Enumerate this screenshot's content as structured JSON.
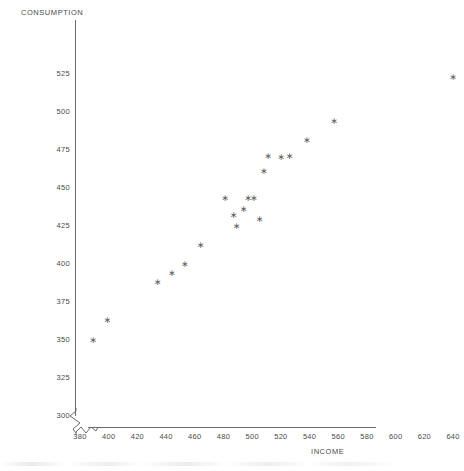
{
  "chart_data": {
    "type": "scatter",
    "title": "",
    "xlabel": "INCOME",
    "ylabel": "CONSUMPTION",
    "xlim": [
      370,
      648
    ],
    "ylim": [
      300,
      528
    ],
    "grid": false,
    "legend": null,
    "axis_breaks": {
      "x": true,
      "y": true
    },
    "marker": "asterisk",
    "marker_color": "#5c5c5c",
    "xticks": [
      380,
      400,
      420,
      440,
      460,
      480,
      500,
      520,
      540,
      560,
      580,
      600,
      620,
      640
    ],
    "yticks": [
      300,
      325,
      350,
      375,
      400,
      425,
      450,
      475,
      500,
      525
    ],
    "x": [
      389,
      399,
      434,
      444,
      453,
      464,
      481,
      487,
      489,
      494,
      497,
      501,
      505,
      508,
      511,
      520,
      526,
      538,
      557,
      640
    ],
    "y": [
      350,
      363,
      388,
      394,
      400,
      412,
      443,
      432,
      425,
      436,
      443,
      443,
      429,
      461,
      471,
      470,
      471,
      481,
      494,
      523
    ],
    "points": [
      {
        "x": 389,
        "y": 350
      },
      {
        "x": 399,
        "y": 363
      },
      {
        "x": 434,
        "y": 388
      },
      {
        "x": 444,
        "y": 394
      },
      {
        "x": 453,
        "y": 400
      },
      {
        "x": 464,
        "y": 412
      },
      {
        "x": 481,
        "y": 443
      },
      {
        "x": 487,
        "y": 432
      },
      {
        "x": 489,
        "y": 425
      },
      {
        "x": 494,
        "y": 436
      },
      {
        "x": 497,
        "y": 443
      },
      {
        "x": 501,
        "y": 443
      },
      {
        "x": 505,
        "y": 429
      },
      {
        "x": 508,
        "y": 461
      },
      {
        "x": 511,
        "y": 471
      },
      {
        "x": 520,
        "y": 470
      },
      {
        "x": 526,
        "y": 471
      },
      {
        "x": 538,
        "y": 481
      },
      {
        "x": 557,
        "y": 494
      },
      {
        "x": 640,
        "y": 523
      }
    ]
  }
}
